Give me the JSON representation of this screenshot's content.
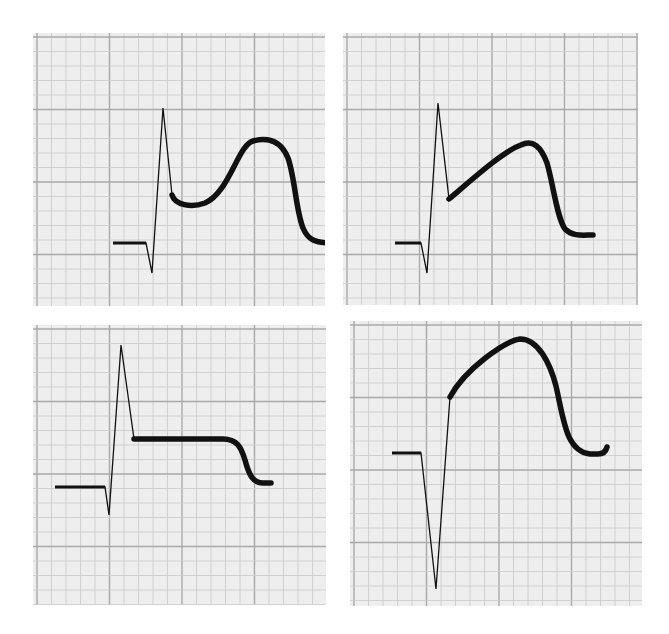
{
  "figure": {
    "grid": {
      "minor_px": 14.5,
      "major_every": 5,
      "background": "#eeeeee",
      "minor_color": "#c9c9c9",
      "major_color": "#a9a9a9"
    },
    "trace_color": "#111111",
    "panels": [
      {
        "id": "top-left",
        "box": [
          33,
          33,
          292,
          273
        ],
        "morphology": "R wave followed by scooped ST dip then dome-shaped plateau",
        "qrs_path": "M80,210 L113,210 L119,240 L130,75 L139,162",
        "st_path": "M139,162 C142,172 158,175 172,170 C196,160 205,112 220,108 C236,104 248,108 255,125 C262,145 263,178 270,195 C275,207 282,210 300,210"
      },
      {
        "id": "top-right",
        "box": [
          343,
          33,
          295,
          272
        ],
        "morphology": "R wave with upsloping ST segment to rounded peak then repolarization",
        "qrs_path": "M52,210 L78,210 L84,240 L95,70 L106,166",
        "st_path": "M106,166 C125,150 160,118 178,112 C190,106 198,114 204,130 C210,150 214,185 222,196 C230,204 240,202 250,202"
      },
      {
        "id": "bottom-left",
        "box": [
          33,
          325,
          293,
          280
        ],
        "morphology": "R wave with flat elevated plateau (square-wave) then return to baseline",
        "qrs_path": "M22,162 L72,162 L76,190 L88,20 L101,114",
        "st_path": "M101,114 L190,114 C204,114 208,122 212,135 C216,150 220,158 230,158 L238,158"
      },
      {
        "id": "bottom-right",
        "box": [
          350,
          321,
          292,
          285
        ],
        "morphology": "Deep QS complex with tombstone-like elevated ST dome",
        "qrs_path": "M42,132 L71,132 L86,268 L100,76",
        "st_path": "M100,76 C115,48 155,20 170,18 C188,18 200,42 206,65 C214,100 216,130 240,133 L248,133 C254,133 256,130 257,126"
      }
    ]
  }
}
